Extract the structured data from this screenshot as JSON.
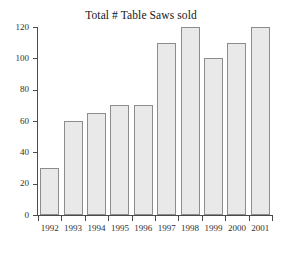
{
  "chart_data": {
    "type": "bar",
    "title": "Total # Table Saws sold",
    "xlabel": "",
    "ylabel": "",
    "categories": [
      "1992",
      "1993",
      "1994",
      "1995",
      "1996",
      "1997",
      "1998",
      "1999",
      "2000",
      "2001"
    ],
    "values": [
      30,
      60,
      65,
      70,
      70,
      110,
      120,
      100,
      110,
      120
    ],
    "ylim": [
      0,
      120
    ],
    "yticks": [
      "0",
      "20",
      "40",
      "60",
      "80",
      "100",
      "120"
    ],
    "ytick_values": [
      0,
      20,
      40,
      60,
      80,
      100,
      120
    ],
    "grid": false,
    "legend": null,
    "bar_fill_color": "#e9e9e9",
    "bar_border_color": "#8c8c8c",
    "axis_color": "#4a4a4a",
    "background_color": "#ffffff"
  }
}
